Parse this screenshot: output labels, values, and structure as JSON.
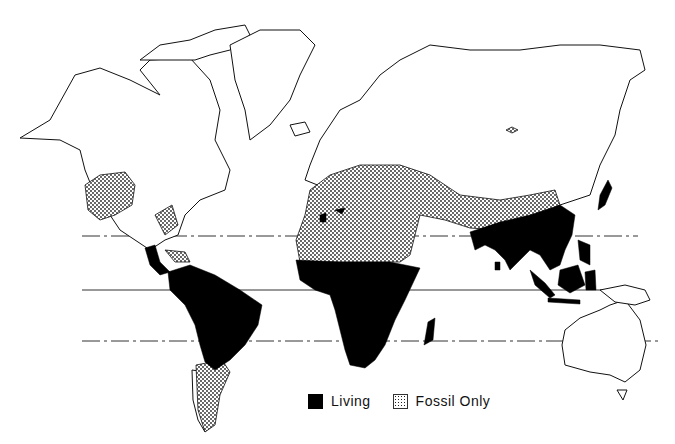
{
  "map": {
    "type": "world distribution map",
    "lines": [
      {
        "name": "tropic-of-cancer",
        "style": "dash-dot",
        "y": 236
      },
      {
        "name": "equator",
        "style": "solid",
        "y": 290
      },
      {
        "name": "tropic-of-capricorn",
        "style": "dash-dot",
        "y": 341
      }
    ],
    "colors": {
      "living": "#000000",
      "fossil": "#222222",
      "outline": "#111111",
      "background": "#ffffff"
    },
    "regions_living": [
      "Central America",
      "South America (north)",
      "Sub-Saharan Africa",
      "Madagascar",
      "Northwest Africa (patches)",
      "South Asia",
      "Southeast Asia",
      "Indonesia",
      "Japan"
    ],
    "regions_fossil_only": [
      "North America (south-central)",
      "Southeast US",
      "Caribbean",
      "Southern South America",
      "Southern Europe",
      "North Africa",
      "Middle East",
      "Central Asia",
      "Eastern Asia (north China)"
    ]
  },
  "legend": {
    "items": [
      {
        "label": "Living",
        "swatch": "solid-black"
      },
      {
        "label": "Fossil Only",
        "swatch": "stipple"
      }
    ]
  }
}
